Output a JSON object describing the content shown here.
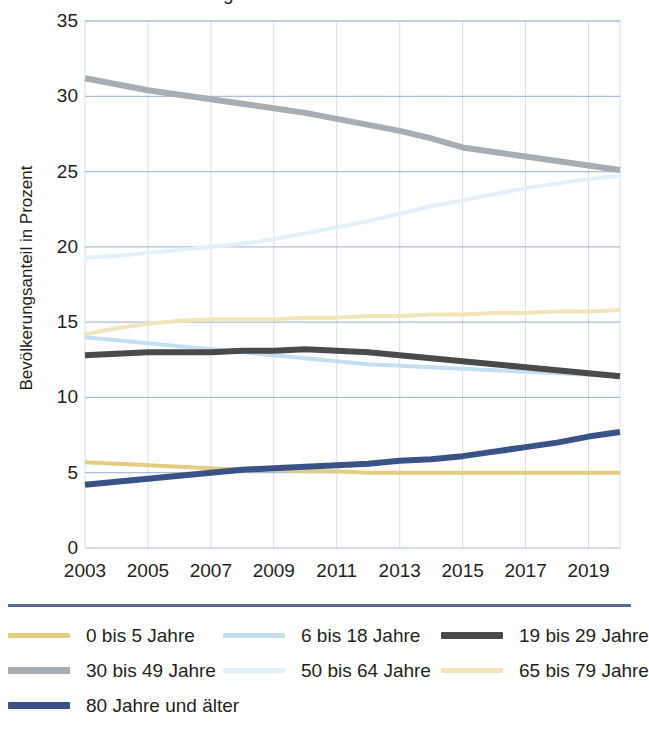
{
  "chart_data": {
    "type": "line",
    "title": "",
    "clipped_title": "Bevölkerung",
    "xlabel": "",
    "ylabel": "Bevölkerungsanteil in Prozent",
    "ylim": [
      0,
      35
    ],
    "ytick_values": [
      0,
      5,
      10,
      15,
      20,
      25,
      30,
      35
    ],
    "xlim": [
      2003,
      2020
    ],
    "xtick_values": [
      2003,
      2005,
      2007,
      2009,
      2011,
      2013,
      2015,
      2017,
      2019
    ],
    "grid": true,
    "legend_position": "bottom",
    "x": [
      2003,
      2004,
      2005,
      2006,
      2007,
      2008,
      2009,
      2010,
      2011,
      2012,
      2013,
      2014,
      2015,
      2016,
      2017,
      2018,
      2019,
      2020
    ],
    "series": [
      {
        "name": "0 bis  5 Jahre",
        "color": "#E3CD80",
        "width": 4,
        "values": [
          5.7,
          5.6,
          5.5,
          5.4,
          5.3,
          5.2,
          5.2,
          5.1,
          5.1,
          5.0,
          5.0,
          5.0,
          5.0,
          5.0,
          5.0,
          5.0,
          5.0,
          5.0
        ]
      },
      {
        "name": "6 bis 18 Jahre",
        "color": "#C4DFF0",
        "width": 4,
        "values": [
          14.0,
          13.8,
          13.6,
          13.4,
          13.2,
          13.0,
          12.8,
          12.6,
          12.4,
          12.2,
          12.1,
          12.0,
          11.9,
          11.8,
          11.7,
          11.6,
          11.5,
          11.4
        ]
      },
      {
        "name": "19 bis 29 Jahre",
        "color": "#4A4A4A",
        "width": 6,
        "values": [
          12.8,
          12.9,
          13.0,
          13.0,
          13.0,
          13.1,
          13.1,
          13.2,
          13.1,
          13.0,
          12.8,
          12.6,
          12.4,
          12.2,
          12.0,
          11.8,
          11.6,
          11.4
        ]
      },
      {
        "name": "30 bis 49 Jahre",
        "color": "#A6ADB3",
        "width": 6,
        "values": [
          31.2,
          30.8,
          30.4,
          30.1,
          29.8,
          29.5,
          29.2,
          28.9,
          28.5,
          28.1,
          27.7,
          27.2,
          26.6,
          26.3,
          26.0,
          25.7,
          25.4,
          25.1
        ]
      },
      {
        "name": "50 bis 64 Jahre",
        "color": "#E2F1F9",
        "width": 4,
        "values": [
          19.3,
          19.4,
          19.6,
          19.8,
          20.0,
          20.2,
          20.5,
          20.9,
          21.3,
          21.7,
          22.2,
          22.7,
          23.1,
          23.5,
          23.9,
          24.2,
          24.5,
          24.7
        ]
      },
      {
        "name": "65 bis 79 Jahre",
        "color": "#F2E5B8",
        "width": 4,
        "values": [
          14.2,
          14.6,
          14.9,
          15.1,
          15.2,
          15.2,
          15.2,
          15.3,
          15.3,
          15.4,
          15.4,
          15.5,
          15.5,
          15.6,
          15.6,
          15.7,
          15.7,
          15.8
        ]
      },
      {
        "name": "80 Jahre und älter",
        "color": "#3A5286",
        "width": 6,
        "values": [
          4.2,
          4.4,
          4.6,
          4.8,
          5.0,
          5.2,
          5.3,
          5.4,
          5.5,
          5.6,
          5.8,
          5.9,
          6.1,
          6.4,
          6.7,
          7.0,
          7.4,
          7.7
        ]
      }
    ],
    "legend_entries": [
      {
        "label": "0 bis  5 Jahre",
        "color": "#E3CD80",
        "thick": false
      },
      {
        "label": "6 bis 18 Jahre",
        "color": "#C4DFF0",
        "thick": false
      },
      {
        "label": "19 bis 29 Jahre",
        "color": "#4A4A4A",
        "thick": true
      },
      {
        "label": "30 bis 49 Jahre",
        "color": "#A6ADB3",
        "thick": true
      },
      {
        "label": "50 bis 64 Jahre",
        "color": "#E2F1F9",
        "thick": false
      },
      {
        "label": "65 bis 79 Jahre",
        "color": "#F2E5B8",
        "thick": false
      },
      {
        "label": "80 Jahre und älter",
        "color": "#3A5286",
        "thick": true
      }
    ],
    "colors": {
      "gridline": "#9FB3D4",
      "axis_rule": "#5b6a94",
      "text": "#231f20"
    }
  }
}
